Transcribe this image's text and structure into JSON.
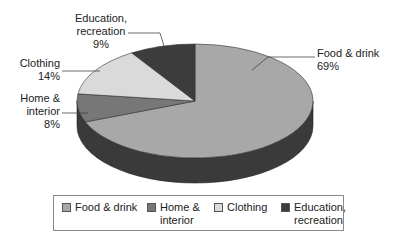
{
  "chart_data": {
    "type": "pie",
    "style": "3d",
    "title": "",
    "categories": [
      "Food & drink",
      "Home & interior",
      "Clothing",
      "Education, recreation"
    ],
    "values": [
      69,
      8,
      14,
      9
    ],
    "unit": "%",
    "colors": [
      "#a8a8a8",
      "#777777",
      "#dadada",
      "#3c3c3c"
    ],
    "side_color": "#3a3a3a",
    "start_angle_deg": 0,
    "direction": "clockwise",
    "legend_position": "bottom"
  },
  "labels": [
    {
      "line1": "Food & drink",
      "line2": "69%"
    },
    {
      "line1": "Home &",
      "line2": "interior",
      "line3": "8%"
    },
    {
      "line1": "Clothing",
      "line2": "14%"
    },
    {
      "line1": "Education,",
      "line2": "recreation",
      "line3": "9%"
    }
  ],
  "legend": [
    {
      "line1": "Food & drink",
      "line2": ""
    },
    {
      "line1": "Home &",
      "line2": "interior"
    },
    {
      "line1": "Clothing",
      "line2": ""
    },
    {
      "line1": "Education,",
      "line2": "recreation"
    }
  ]
}
